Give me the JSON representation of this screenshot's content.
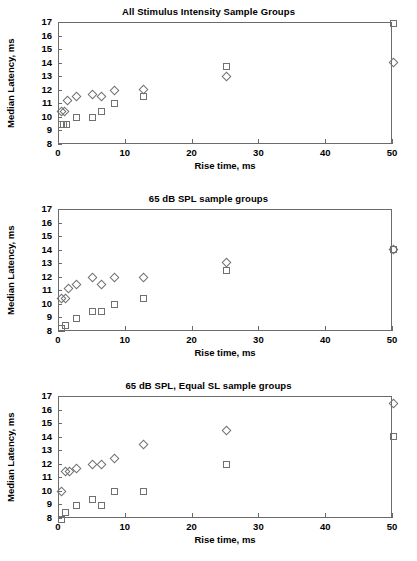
{
  "figure": {
    "width": 417,
    "height": 561,
    "background": "#ffffff",
    "axis_color": "#6b6b6b",
    "marker_color": "#707070"
  },
  "panels": [
    {
      "title": "All Stimulus Intensity Sample Groups",
      "xlabel": "Rise time, ms",
      "ylabel": "Median Latency, ms"
    },
    {
      "title": "65 dB SPL sample groups",
      "xlabel": "Rise time, ms",
      "ylabel": "Median Latency, ms"
    },
    {
      "title": "65 dB SPL, Equal SL sample groups",
      "xlabel": "Rise time, ms",
      "ylabel": "Median Latency, ms"
    }
  ],
  "axes": {
    "yticks": [
      8,
      9,
      10,
      11,
      12,
      13,
      14,
      15,
      16,
      17
    ],
    "ytick_labels": [
      "8",
      "9",
      "10",
      "11",
      "12",
      "13",
      "14",
      "15",
      "16",
      "17"
    ],
    "xticks": [
      0,
      10,
      20,
      30,
      40,
      50
    ],
    "xtick_labels": [
      "0",
      "10",
      "20",
      "30",
      "40",
      "50"
    ],
    "xlim": [
      0,
      50
    ],
    "ylim": [
      8,
      17
    ],
    "grid": false
  },
  "chart_data": [
    {
      "type": "scatter",
      "title": "All Stimulus Intensity Sample Groups",
      "xlabel": "Rise time, ms",
      "ylabel": "Median Latency, ms",
      "xlim": [
        0,
        50
      ],
      "ylim": [
        8,
        17
      ],
      "xticks": [
        0,
        10,
        20,
        30,
        40,
        50
      ],
      "yticks": [
        8,
        9,
        10,
        11,
        12,
        13,
        14,
        15,
        16,
        17
      ],
      "grid": false,
      "legend": "none",
      "series": [
        {
          "name": "diamond",
          "marker": "diamond",
          "points": [
            {
              "x": 0.4,
              "y": 10.45
            },
            {
              "x": 0.8,
              "y": 10.5
            },
            {
              "x": 1.3,
              "y": 11.3
            },
            {
              "x": 2.6,
              "y": 11.6
            },
            {
              "x": 5.0,
              "y": 11.75
            },
            {
              "x": 6.4,
              "y": 11.55
            },
            {
              "x": 8.3,
              "y": 12.05
            },
            {
              "x": 12.6,
              "y": 12.1
            },
            {
              "x": 25.0,
              "y": 13.05
            },
            {
              "x": 50.0,
              "y": 14.05
            }
          ]
        },
        {
          "name": "square",
          "marker": "square",
          "points": [
            {
              "x": 0.3,
              "y": 9.5
            },
            {
              "x": 0.7,
              "y": 9.5
            },
            {
              "x": 1.1,
              "y": 9.5
            },
            {
              "x": 2.6,
              "y": 10.0
            },
            {
              "x": 5.0,
              "y": 10.0
            },
            {
              "x": 6.4,
              "y": 10.45
            },
            {
              "x": 8.3,
              "y": 11.05
            },
            {
              "x": 12.6,
              "y": 11.6
            },
            {
              "x": 25.0,
              "y": 13.8
            },
            {
              "x": 50.0,
              "y": 17.0
            }
          ]
        }
      ]
    },
    {
      "type": "scatter",
      "title": "65 dB SPL sample groups",
      "xlabel": "Rise time, ms",
      "ylabel": "Median Latency, ms",
      "xlim": [
        0,
        50
      ],
      "ylim": [
        8,
        17
      ],
      "xticks": [
        0,
        10,
        20,
        30,
        40,
        50
      ],
      "yticks": [
        8,
        9,
        10,
        11,
        12,
        13,
        14,
        15,
        16,
        17
      ],
      "grid": false,
      "legend": "none",
      "series": [
        {
          "name": "diamond",
          "marker": "diamond",
          "points": [
            {
              "x": 0.4,
              "y": 10.45
            },
            {
              "x": 0.9,
              "y": 10.45
            },
            {
              "x": 1.4,
              "y": 11.2
            },
            {
              "x": 2.6,
              "y": 11.5
            },
            {
              "x": 5.0,
              "y": 12.0
            },
            {
              "x": 6.4,
              "y": 11.5
            },
            {
              "x": 8.3,
              "y": 12.0
            },
            {
              "x": 12.6,
              "y": 12.0
            },
            {
              "x": 25.0,
              "y": 13.1
            },
            {
              "x": 50.0,
              "y": 14.05
            }
          ]
        },
        {
          "name": "square",
          "marker": "square",
          "points": [
            {
              "x": 0.3,
              "y": 8.25
            },
            {
              "x": 1.0,
              "y": 8.45
            },
            {
              "x": 2.6,
              "y": 9.0
            },
            {
              "x": 5.0,
              "y": 9.5
            },
            {
              "x": 6.4,
              "y": 9.5
            },
            {
              "x": 8.3,
              "y": 10.0
            },
            {
              "x": 12.6,
              "y": 10.5
            },
            {
              "x": 25.0,
              "y": 12.55
            },
            {
              "x": 50.0,
              "y": 14.05
            }
          ]
        }
      ]
    },
    {
      "type": "scatter",
      "title": "65 dB SPL, Equal SL sample groups",
      "xlabel": "Rise time, ms",
      "ylabel": "Median Latency, ms",
      "xlim": [
        0,
        50
      ],
      "ylim": [
        8,
        17
      ],
      "xticks": [
        0,
        10,
        20,
        30,
        40,
        50
      ],
      "yticks": [
        8,
        9,
        10,
        11,
        12,
        13,
        14,
        15,
        16,
        17
      ],
      "grid": false,
      "legend": "none",
      "series": [
        {
          "name": "diamond",
          "marker": "diamond",
          "points": [
            {
              "x": 0.3,
              "y": 10.0
            },
            {
              "x": 1.0,
              "y": 11.5
            },
            {
              "x": 1.5,
              "y": 11.5
            },
            {
              "x": 2.6,
              "y": 11.75
            },
            {
              "x": 5.0,
              "y": 12.0
            },
            {
              "x": 6.4,
              "y": 12.0
            },
            {
              "x": 8.3,
              "y": 12.5
            },
            {
              "x": 12.6,
              "y": 13.5
            },
            {
              "x": 25.0,
              "y": 14.55
            },
            {
              "x": 50.0,
              "y": 16.5
            }
          ]
        },
        {
          "name": "square",
          "marker": "square",
          "points": [
            {
              "x": 0.3,
              "y": 8.0
            },
            {
              "x": 0.9,
              "y": 8.5
            },
            {
              "x": 2.6,
              "y": 9.0
            },
            {
              "x": 5.0,
              "y": 9.45
            },
            {
              "x": 6.4,
              "y": 9.0
            },
            {
              "x": 8.3,
              "y": 10.0
            },
            {
              "x": 12.6,
              "y": 10.0
            },
            {
              "x": 25.0,
              "y": 12.0
            },
            {
              "x": 50.0,
              "y": 14.05
            }
          ]
        }
      ]
    }
  ]
}
